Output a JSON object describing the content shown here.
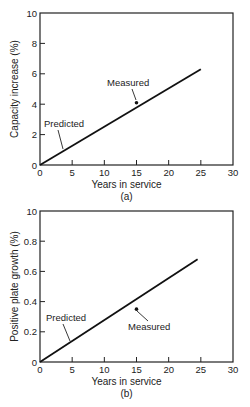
{
  "chart_data": [
    {
      "type": "line",
      "panel_label": "(a)",
      "title": "",
      "xlabel": "Years in service",
      "ylabel": "Capacity increase (%)",
      "xlim": [
        0,
        30
      ],
      "ylim": [
        0,
        10
      ],
      "x_ticks": [
        0,
        5,
        10,
        15,
        20,
        25,
        30
      ],
      "x_tick_labels": [
        "0",
        "5",
        "10",
        "15",
        "20",
        "25",
        "30"
      ],
      "y_ticks": [
        0,
        2,
        4,
        6,
        8,
        10
      ],
      "y_tick_labels": [
        "0",
        "2",
        "4",
        "6",
        "8",
        "10"
      ],
      "grid": false,
      "series": [
        {
          "name": "Predicted",
          "kind": "line",
          "x": [
            0,
            25
          ],
          "y": [
            0,
            6.3
          ]
        },
        {
          "name": "Measured",
          "kind": "scatter",
          "x": [
            15
          ],
          "y": [
            4.1
          ]
        }
      ],
      "annotations": [
        {
          "text": "Predicted",
          "target": "Predicted"
        },
        {
          "text": "Measured",
          "target": "Measured"
        }
      ]
    },
    {
      "type": "line",
      "panel_label": "(b)",
      "title": "",
      "xlabel": "Years in service",
      "ylabel": "Positive plate growth (%)",
      "xlim": [
        0,
        30
      ],
      "ylim": [
        0,
        1.0
      ],
      "x_ticks": [
        0,
        5,
        10,
        15,
        20,
        25,
        30
      ],
      "x_tick_labels": [
        "0",
        "5",
        "10",
        "15",
        "20",
        "25",
        "30"
      ],
      "y_ticks": [
        0,
        0.2,
        0.4,
        0.6,
        0.8,
        1.0
      ],
      "y_tick_labels": [
        "0",
        "0.2",
        "0.4",
        "0.6",
        "0.8",
        "10"
      ],
      "grid": false,
      "series": [
        {
          "name": "Predicted",
          "kind": "line",
          "x": [
            0,
            24.5
          ],
          "y": [
            0,
            0.68
          ]
        },
        {
          "name": "Measured",
          "kind": "scatter",
          "x": [
            15
          ],
          "y": [
            0.35
          ]
        }
      ],
      "annotations": [
        {
          "text": "Predicted",
          "target": "Predicted"
        },
        {
          "text": "Measured",
          "target": "Measured"
        }
      ]
    }
  ]
}
